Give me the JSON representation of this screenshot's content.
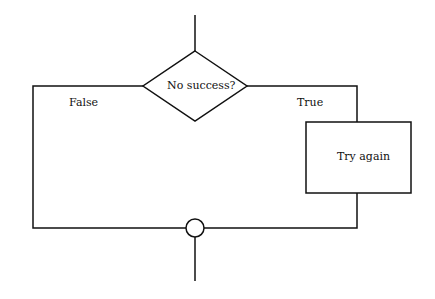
{
  "diagram": {
    "type": "flowchart",
    "decision": {
      "label": "No success?"
    },
    "process": {
      "label": "Try again"
    },
    "branches": {
      "false_label": "False",
      "true_label": "True"
    },
    "colors": {
      "stroke": "#111111",
      "background": "#ffffff"
    }
  }
}
